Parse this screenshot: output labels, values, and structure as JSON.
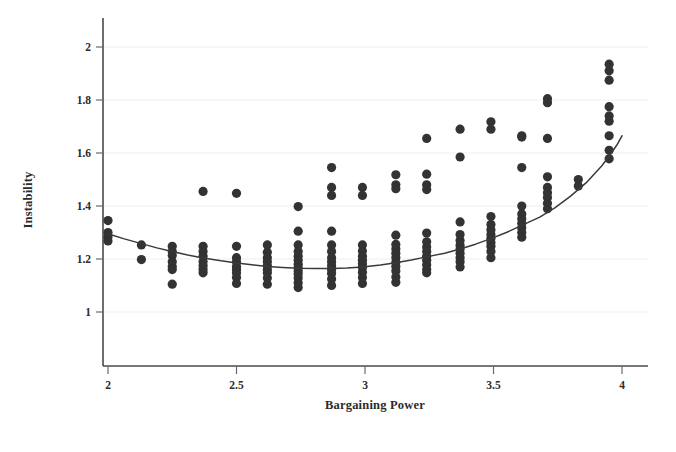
{
  "chart_data": {
    "type": "scatter",
    "title": "",
    "xlabel": "Bargaining Power",
    "ylabel": "Instability",
    "xlim": [
      1.93,
      4.07
    ],
    "ylim": [
      0.93,
      2.06
    ],
    "xticks": [
      2,
      2.5,
      3,
      3.5,
      4
    ],
    "xtick_labels": [
      "2",
      "2.5",
      "3",
      "3.5",
      "4"
    ],
    "yticks": [
      1,
      1.2,
      1.4,
      1.6,
      1.8,
      2
    ],
    "ytick_labels": [
      "1",
      "1.2",
      "1.4",
      "1.6",
      "1.8",
      "2"
    ],
    "grid": "horizontal-faint",
    "legend": null,
    "marker": {
      "shape": "circle",
      "color": "#333333",
      "size": 4.6
    },
    "series": [
      {
        "name": "observations",
        "points": [
          [
            2.0,
            1.345
          ],
          [
            2.0,
            1.3
          ],
          [
            2.0,
            1.283
          ],
          [
            2.0,
            1.268
          ],
          [
            2.13,
            1.253
          ],
          [
            2.13,
            1.198
          ],
          [
            2.25,
            1.248
          ],
          [
            2.25,
            1.228
          ],
          [
            2.25,
            1.213
          ],
          [
            2.25,
            1.19
          ],
          [
            2.25,
            1.172
          ],
          [
            2.25,
            1.16
          ],
          [
            2.25,
            1.105
          ],
          [
            2.37,
            1.455
          ],
          [
            2.37,
            1.248
          ],
          [
            2.37,
            1.228
          ],
          [
            2.37,
            1.21
          ],
          [
            2.37,
            1.19
          ],
          [
            2.37,
            1.175
          ],
          [
            2.37,
            1.16
          ],
          [
            2.37,
            1.148
          ],
          [
            2.5,
            1.448
          ],
          [
            2.5,
            1.248
          ],
          [
            2.5,
            1.205
          ],
          [
            2.5,
            1.19
          ],
          [
            2.5,
            1.172
          ],
          [
            2.5,
            1.16
          ],
          [
            2.5,
            1.148
          ],
          [
            2.5,
            1.13
          ],
          [
            2.5,
            1.108
          ],
          [
            2.62,
            1.253
          ],
          [
            2.62,
            1.225
          ],
          [
            2.62,
            1.205
          ],
          [
            2.62,
            1.19
          ],
          [
            2.62,
            1.175
          ],
          [
            2.62,
            1.16
          ],
          [
            2.62,
            1.148
          ],
          [
            2.62,
            1.128
          ],
          [
            2.62,
            1.105
          ],
          [
            2.74,
            1.398
          ],
          [
            2.74,
            1.305
          ],
          [
            2.74,
            1.253
          ],
          [
            2.74,
            1.228
          ],
          [
            2.74,
            1.21
          ],
          [
            2.74,
            1.195
          ],
          [
            2.74,
            1.18
          ],
          [
            2.74,
            1.168
          ],
          [
            2.74,
            1.155
          ],
          [
            2.74,
            1.143
          ],
          [
            2.74,
            1.128
          ],
          [
            2.74,
            1.11
          ],
          [
            2.74,
            1.092
          ],
          [
            2.87,
            1.545
          ],
          [
            2.87,
            1.47
          ],
          [
            2.87,
            1.44
          ],
          [
            2.87,
            1.305
          ],
          [
            2.87,
            1.253
          ],
          [
            2.87,
            1.228
          ],
          [
            2.87,
            1.205
          ],
          [
            2.87,
            1.19
          ],
          [
            2.87,
            1.175
          ],
          [
            2.87,
            1.16
          ],
          [
            2.87,
            1.145
          ],
          [
            2.87,
            1.125
          ],
          [
            2.87,
            1.1
          ],
          [
            2.99,
            1.47
          ],
          [
            2.99,
            1.44
          ],
          [
            2.99,
            1.253
          ],
          [
            2.99,
            1.23
          ],
          [
            2.99,
            1.21
          ],
          [
            2.99,
            1.195
          ],
          [
            2.99,
            1.182
          ],
          [
            2.99,
            1.168
          ],
          [
            2.99,
            1.15
          ],
          [
            2.99,
            1.13
          ],
          [
            2.99,
            1.108
          ],
          [
            3.12,
            1.518
          ],
          [
            3.12,
            1.48
          ],
          [
            3.12,
            1.465
          ],
          [
            3.12,
            1.29
          ],
          [
            3.12,
            1.255
          ],
          [
            3.12,
            1.238
          ],
          [
            3.12,
            1.222
          ],
          [
            3.12,
            1.205
          ],
          [
            3.12,
            1.188
          ],
          [
            3.12,
            1.172
          ],
          [
            3.12,
            1.155
          ],
          [
            3.12,
            1.132
          ],
          [
            3.12,
            1.112
          ],
          [
            3.24,
            1.655
          ],
          [
            3.24,
            1.52
          ],
          [
            3.24,
            1.48
          ],
          [
            3.24,
            1.462
          ],
          [
            3.24,
            1.298
          ],
          [
            3.24,
            1.265
          ],
          [
            3.24,
            1.245
          ],
          [
            3.24,
            1.228
          ],
          [
            3.24,
            1.21
          ],
          [
            3.24,
            1.195
          ],
          [
            3.24,
            1.178
          ],
          [
            3.24,
            1.16
          ],
          [
            3.24,
            1.148
          ],
          [
            3.37,
            1.69
          ],
          [
            3.37,
            1.585
          ],
          [
            3.37,
            1.34
          ],
          [
            3.37,
            1.292
          ],
          [
            3.37,
            1.27
          ],
          [
            3.37,
            1.252
          ],
          [
            3.37,
            1.238
          ],
          [
            3.37,
            1.222
          ],
          [
            3.37,
            1.205
          ],
          [
            3.37,
            1.19
          ],
          [
            3.37,
            1.17
          ],
          [
            3.49,
            1.718
          ],
          [
            3.49,
            1.69
          ],
          [
            3.49,
            1.36
          ],
          [
            3.49,
            1.33
          ],
          [
            3.49,
            1.31
          ],
          [
            3.49,
            1.292
          ],
          [
            3.49,
            1.278
          ],
          [
            3.49,
            1.262
          ],
          [
            3.49,
            1.248
          ],
          [
            3.49,
            1.228
          ],
          [
            3.49,
            1.205
          ],
          [
            3.61,
            1.665
          ],
          [
            3.61,
            1.66
          ],
          [
            3.61,
            1.545
          ],
          [
            3.61,
            1.4
          ],
          [
            3.61,
            1.37
          ],
          [
            3.61,
            1.352
          ],
          [
            3.61,
            1.335
          ],
          [
            3.61,
            1.318
          ],
          [
            3.61,
            1.3
          ],
          [
            3.61,
            1.282
          ],
          [
            3.71,
            1.805
          ],
          [
            3.71,
            1.79
          ],
          [
            3.71,
            1.655
          ],
          [
            3.71,
            1.51
          ],
          [
            3.71,
            1.47
          ],
          [
            3.71,
            1.45
          ],
          [
            3.71,
            1.432
          ],
          [
            3.71,
            1.41
          ],
          [
            3.71,
            1.39
          ],
          [
            3.83,
            1.5
          ],
          [
            3.83,
            1.475
          ],
          [
            3.95,
            1.935
          ],
          [
            3.95,
            1.91
          ],
          [
            3.95,
            1.875
          ],
          [
            3.95,
            1.775
          ],
          [
            3.95,
            1.74
          ],
          [
            3.95,
            1.72
          ],
          [
            3.95,
            1.665
          ],
          [
            3.95,
            1.61
          ],
          [
            3.95,
            1.578
          ]
        ]
      }
    ],
    "fit_line": {
      "name": "smoothed fit",
      "color": "#3a3a3a",
      "points": [
        [
          2.0,
          1.295
        ],
        [
          2.06,
          1.277
        ],
        [
          2.13,
          1.258
        ],
        [
          2.19,
          1.242
        ],
        [
          2.25,
          1.228
        ],
        [
          2.31,
          1.215
        ],
        [
          2.37,
          1.204
        ],
        [
          2.44,
          1.193
        ],
        [
          2.5,
          1.185
        ],
        [
          2.56,
          1.178
        ],
        [
          2.62,
          1.172
        ],
        [
          2.68,
          1.168
        ],
        [
          2.74,
          1.165
        ],
        [
          2.81,
          1.164
        ],
        [
          2.87,
          1.164
        ],
        [
          2.93,
          1.166
        ],
        [
          2.99,
          1.17
        ],
        [
          3.06,
          1.177
        ],
        [
          3.12,
          1.186
        ],
        [
          3.18,
          1.196
        ],
        [
          3.24,
          1.208
        ],
        [
          3.31,
          1.222
        ],
        [
          3.37,
          1.238
        ],
        [
          3.43,
          1.256
        ],
        [
          3.49,
          1.277
        ],
        [
          3.55,
          1.3
        ],
        [
          3.61,
          1.327
        ],
        [
          3.68,
          1.358
        ],
        [
          3.74,
          1.394
        ],
        [
          3.8,
          1.437
        ],
        [
          3.86,
          1.487
        ],
        [
          3.92,
          1.55
        ],
        [
          3.95,
          1.588
        ],
        [
          3.98,
          1.63
        ],
        [
          4.0,
          1.665
        ]
      ]
    }
  },
  "axes": {
    "x_title": "Bargaining Power",
    "y_title": "Instability"
  }
}
